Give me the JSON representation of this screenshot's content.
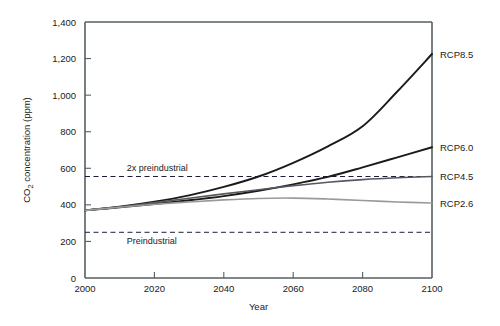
{
  "chart_data": {
    "type": "line",
    "title": "",
    "xlabel": "Year",
    "ylabel": "CO2 concentration (ppm)",
    "ylabel_display": "CO₂ concentration (ppm)",
    "xlim": [
      2000,
      2100
    ],
    "ylim": [
      0,
      1400
    ],
    "grid": false,
    "legend_position": "right-of-plot-end-labels",
    "x": [
      2000,
      2010,
      2020,
      2030,
      2040,
      2050,
      2060,
      2070,
      2080,
      2090,
      2100
    ],
    "xticks": [
      "2000",
      "2020",
      "2040",
      "2060",
      "2080",
      "2100"
    ],
    "xtick_values": [
      2000,
      2020,
      2040,
      2060,
      2080,
      2100
    ],
    "yticks": [
      "0",
      "200",
      "400",
      "600",
      "800",
      "1,000",
      "1,200",
      "1,400"
    ],
    "ytick_values": [
      0,
      200,
      400,
      600,
      800,
      1000,
      1200,
      1400
    ],
    "series": [
      {
        "name": "RCP8.5",
        "label": "RCP8.5",
        "color": "#1a1a1a",
        "width": 1.9,
        "values": [
          370,
          390,
          417,
          452,
          498,
          555,
          630,
          720,
          830,
          1020,
          1225
        ]
      },
      {
        "name": "RCP6.0",
        "label": "RCP6.0",
        "color": "#1a1a1a",
        "width": 1.9,
        "values": [
          370,
          386,
          405,
          425,
          448,
          477,
          512,
          553,
          605,
          660,
          715
        ]
      },
      {
        "name": "RCP4.5",
        "label": "RCP4.5",
        "color": "#55595c",
        "width": 1.6,
        "values": [
          370,
          389,
          412,
          436,
          460,
          483,
          505,
          524,
          538,
          548,
          555
        ]
      },
      {
        "name": "RCP2.6",
        "label": "RCP2.6",
        "color": "#9a9a9a",
        "width": 1.6,
        "values": [
          370,
          387,
          403,
          416,
          427,
          435,
          437,
          432,
          424,
          416,
          410
        ]
      }
    ],
    "reference_lines": [
      {
        "name": "2x preindustrial",
        "label": "2x preindustrial",
        "value": 555,
        "style": "dashed",
        "color": "#1b1b3a",
        "label_x": 2012,
        "label_dy": -6
      },
      {
        "name": "Preindustrial",
        "label": "Preindustrial",
        "value": 250,
        "style": "dashed",
        "color": "#1b1b3a",
        "label_x": 2012,
        "label_dy": 12
      }
    ]
  }
}
